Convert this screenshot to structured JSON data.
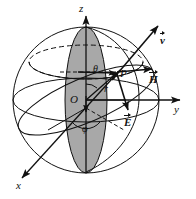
{
  "figure": {
    "name": "spherical-coordinate-system-diagram",
    "type": "physics-geometry-diagram",
    "background_color": "#ffffff",
    "line_color": "#111111",
    "shaded_region_color": "#a8a8a8",
    "width": 196,
    "height": 199
  },
  "axes": {
    "z": {
      "label": "z",
      "direction": "up",
      "arrow": true
    },
    "y": {
      "label": "y",
      "direction": "right",
      "arrow": true
    },
    "x": {
      "label": "x",
      "direction": "lower-left",
      "arrow": true
    }
  },
  "points": {
    "origin": {
      "label": "O"
    },
    "p": {
      "label": "P"
    }
  },
  "angles": {
    "theta": {
      "label": "θ",
      "description": "polar angle from z-axis"
    },
    "phi": {
      "label": "φ",
      "description": "azimuthal angle in xy-plane"
    }
  },
  "radius": {
    "label": "r",
    "description": "radius vector from origin to P"
  },
  "vectors": [
    {
      "symbol": "v",
      "label": "v",
      "overline_arrow": true,
      "name": "velocity-vector",
      "description": "points up-right from P"
    },
    {
      "symbol": "H",
      "label": "H",
      "overline_arrow": true,
      "name": "magnetic-field-vector",
      "description": "points right from P"
    },
    {
      "symbol": "E",
      "label": "E",
      "overline_arrow": true,
      "name": "electric-field-vector",
      "description": "points down from P"
    }
  ],
  "shapes": {
    "sphere_outline": "great circle outline of sphere",
    "equatorial_ellipse": "horizontal ellipse through center",
    "meridian_ellipse": "vertical shaded ellipse through poles",
    "latitude_circle": "dashed upper latitude circle"
  }
}
